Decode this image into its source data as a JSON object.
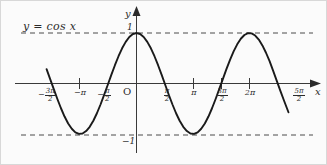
{
  "figure": {
    "equation_label": "y = cos x",
    "axis_x_name": "x",
    "axis_y_name": "y",
    "origin_label": "O",
    "colors": {
      "background": "#fbfbfb",
      "curve": "#1a1a1a",
      "axis": "#3a3a3a",
      "dashed_guide": "#4a4a4a",
      "text": "#2b2b2b",
      "border": "#d8d8d8"
    }
  },
  "chart_data": {
    "type": "line",
    "title": "y = cos x",
    "xlabel": "x",
    "ylabel": "y",
    "function": "y = cos x",
    "xlim": [
      -5.0,
      8.45
    ],
    "ylim": [
      -1.45,
      1.45
    ],
    "grid": false,
    "legend": "none",
    "x_tick_labels": [
      "-3π/2",
      "-π",
      "-π/2",
      "O",
      "π/2",
      "π",
      "3π/2",
      "2π",
      "5π/2"
    ],
    "x_tick_values": [
      -4.712,
      -3.1416,
      -1.5708,
      0,
      1.5708,
      3.1416,
      4.712,
      6.2832,
      7.854
    ],
    "y_tick_labels": [
      "1",
      "-1"
    ],
    "y_tick_values": [
      1,
      -1
    ],
    "guide_lines": [
      {
        "y": 1,
        "style": "dashed"
      },
      {
        "y": -1,
        "style": "dashed"
      }
    ],
    "maxima": [
      {
        "x": 0,
        "y": 1
      },
      {
        "x": 6.2832,
        "y": 1
      }
    ],
    "minima": [
      {
        "x": -3.1416,
        "y": -1
      },
      {
        "x": 3.1416,
        "y": -1
      }
    ],
    "zeros": [
      -4.712,
      -1.5708,
      1.5708,
      4.712,
      7.854
    ],
    "series": [
      {
        "name": "cos x",
        "x": [
          -5.0,
          -4.8,
          -4.6,
          -4.4,
          -4.2,
          -4.0,
          -3.8,
          -3.6,
          -3.4,
          -3.2,
          -3.0,
          -2.8,
          -2.6,
          -2.4,
          -2.2,
          -2.0,
          -1.8,
          -1.6,
          -1.4,
          -1.2,
          -1.0,
          -0.8,
          -0.6,
          -0.4,
          -0.2,
          0.0,
          0.2,
          0.4,
          0.6,
          0.8,
          1.0,
          1.2,
          1.4,
          1.6,
          1.8,
          2.0,
          2.2,
          2.4,
          2.6,
          2.8,
          3.0,
          3.2,
          3.4,
          3.6,
          3.8,
          4.0,
          4.2,
          4.4,
          4.6,
          4.8,
          5.0,
          5.2,
          5.4,
          5.6,
          5.8,
          6.0,
          6.2,
          6.4,
          6.6,
          6.8,
          7.0,
          7.2,
          7.4,
          7.6,
          7.8,
          8.0,
          8.2,
          8.45
        ],
        "y": [
          0.284,
          0.087,
          -0.112,
          -0.307,
          -0.49,
          -0.654,
          -0.791,
          -0.897,
          -0.967,
          -0.998,
          -0.99,
          -0.942,
          -0.857,
          -0.737,
          -0.589,
          -0.416,
          -0.227,
          -0.029,
          0.17,
          0.362,
          0.54,
          0.697,
          0.825,
          0.921,
          0.98,
          1.0,
          0.98,
          0.921,
          0.825,
          0.697,
          0.54,
          0.362,
          0.17,
          -0.029,
          -0.227,
          -0.416,
          -0.589,
          -0.737,
          -0.857,
          -0.942,
          -0.99,
          -0.998,
          -0.967,
          -0.897,
          -0.791,
          -0.654,
          -0.49,
          -0.307,
          -0.112,
          0.087,
          0.284,
          0.469,
          0.635,
          0.776,
          0.886,
          0.96,
          0.997,
          0.993,
          0.95,
          0.869,
          0.754,
          0.609,
          0.442,
          0.251,
          0.052,
          -0.146,
          -0.337,
          -0.57
        ]
      }
    ]
  },
  "labels": {
    "y_value_top": "1",
    "y_value_bottom": "−1",
    "minus": "−",
    "pi": "π",
    "two_pi": "2π",
    "neg_pi": "−π",
    "num_3": "3π",
    "num_5": "5π",
    "den_2": "2"
  }
}
